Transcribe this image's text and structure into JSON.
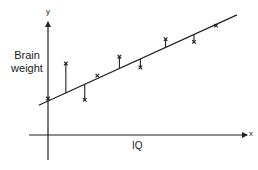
{
  "chart_data": {
    "type": "scatter",
    "title": "",
    "xlabel": "IQ",
    "ylabel": "Brain weight",
    "x_axis_letter": "x",
    "y_axis_letter": "y",
    "grid": false,
    "legend": null,
    "ticks": {
      "x": [],
      "y": []
    },
    "axis_ranges": {
      "x": [
        0,
        10
      ],
      "y": [
        0,
        5
      ]
    },
    "regression_line": {
      "x": [
        -0.44,
        9.0
      ],
      "y": [
        1.1,
        4.45
      ]
    },
    "points": [
      {
        "x": 0.0,
        "y": 1.35,
        "residual_shown": false
      },
      {
        "x": 0.85,
        "y": 2.65,
        "residual_shown": true
      },
      {
        "x": 1.75,
        "y": 1.3,
        "residual_shown": true
      },
      {
        "x": 2.35,
        "y": 2.2,
        "residual_shown": false
      },
      {
        "x": 3.4,
        "y": 2.9,
        "residual_shown": true
      },
      {
        "x": 4.4,
        "y": 2.5,
        "residual_shown": true
      },
      {
        "x": 5.6,
        "y": 3.55,
        "residual_shown": true
      },
      {
        "x": 6.95,
        "y": 3.45,
        "residual_shown": true
      },
      {
        "x": 8.0,
        "y": 4.05,
        "residual_shown": false
      }
    ],
    "annotations": [
      "Vertical segments show residuals between each observation (x) and the fitted line"
    ]
  },
  "colors": {
    "ink": "#222222",
    "background": "#ffffff"
  },
  "layout_px": {
    "origin": {
      "x": 48,
      "y": 135
    },
    "x_scale": 21,
    "y_scale": 27
  }
}
